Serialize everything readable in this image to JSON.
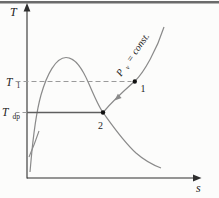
{
  "page": {
    "background": "#fcfcfb",
    "top_border_color": "#6b6b6b"
  },
  "diagram": {
    "colors": {
      "axis": "#2e2e2e",
      "curve": "#8a8a8a",
      "dashed": "#9a9a9a",
      "tie_line": "#5f5f5f",
      "point": "#111111",
      "text": "#1c1c1c"
    },
    "y_axis_label": "T",
    "x_axis_label": "s",
    "t1_label": {
      "base": "T",
      "sub": "1"
    },
    "tdp_label": {
      "base": "T",
      "sub": "dp"
    },
    "point1_label": "1",
    "point2_label": "2",
    "pressure_label": {
      "base": "P",
      "sub": "v",
      "rest": " = const."
    }
  }
}
